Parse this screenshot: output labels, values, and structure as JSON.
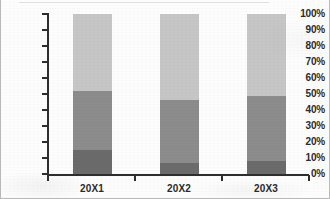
{
  "chart_data": {
    "type": "bar",
    "subtype": "stacked-100-percent",
    "title": "",
    "xlabel": "",
    "ylabel": "",
    "categories": [
      "20X1",
      "20X2",
      "20X3"
    ],
    "series": [
      {
        "name": "Series 1",
        "color": "#6b6b6b",
        "values": [
          15,
          7,
          8
        ]
      },
      {
        "name": "Series 2",
        "color": "#8c8c8c",
        "values": [
          37,
          39,
          41
        ]
      },
      {
        "name": "Series 3",
        "color": "#c6c6c6",
        "values": [
          48,
          54,
          51
        ]
      }
    ],
    "cumulative_tops": [
      {
        "category": "20X1",
        "tops": [
          15,
          52,
          100
        ]
      },
      {
        "category": "20X2",
        "tops": [
          7,
          46,
          100
        ]
      },
      {
        "category": "20X3",
        "tops": [
          8,
          49,
          100
        ]
      }
    ],
    "ylim": [
      0,
      100
    ],
    "ytick_step": 10,
    "ytick_labels": [
      "100%",
      "90%",
      "80%",
      "70%",
      "60%",
      "50%",
      "40%",
      "30%",
      "20%",
      "10%",
      "0%"
    ],
    "ytick_values": [
      100,
      90,
      80,
      70,
      60,
      50,
      40,
      30,
      20,
      10,
      0
    ],
    "grid": false,
    "legend": false,
    "legend_position": "none",
    "axis_color": "#2e2e2e",
    "plot_background": "#fdfdfd"
  },
  "axes": {
    "y_ticks": [
      {
        "label": "100%",
        "value": 100
      },
      {
        "label": "90%",
        "value": 90
      },
      {
        "label": "80%",
        "value": 80
      },
      {
        "label": "70%",
        "value": 70
      },
      {
        "label": "60%",
        "value": 60
      },
      {
        "label": "50%",
        "value": 50
      },
      {
        "label": "40%",
        "value": 40
      },
      {
        "label": "30%",
        "value": 30
      },
      {
        "label": "20%",
        "value": 20
      },
      {
        "label": "10%",
        "value": 10
      },
      {
        "label": "0%",
        "value": 0
      }
    ],
    "x_categories": [
      {
        "label": "20X1"
      },
      {
        "label": "20X2"
      },
      {
        "label": "20X3"
      }
    ]
  }
}
